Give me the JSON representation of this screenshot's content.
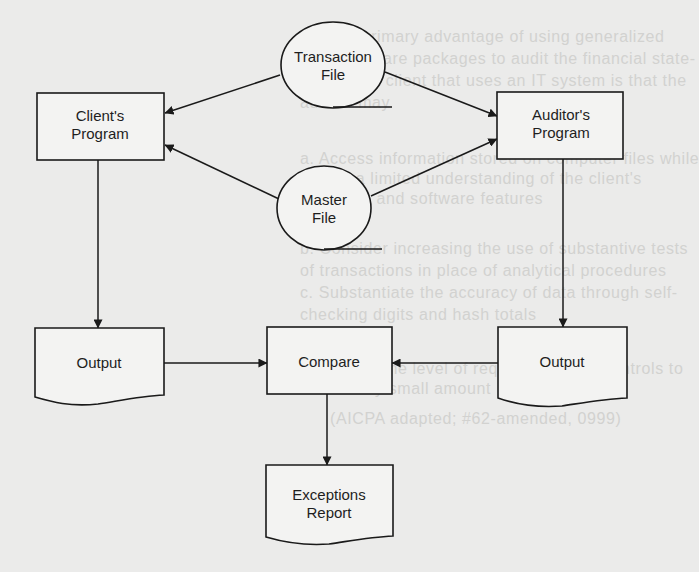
{
  "diagram": {
    "type": "flowchart",
    "colors": {
      "background": "#ebebea",
      "stroke": "#1a1a1a",
      "text": "#1e1e1e",
      "bleed_text": "#d2d2d0"
    },
    "nodes": {
      "transaction_file": {
        "shape": "storage-circle",
        "line1": "Transaction",
        "line2": "File"
      },
      "master_file": {
        "shape": "storage-circle",
        "line1": "Master",
        "line2": "File"
      },
      "clients_program": {
        "shape": "process",
        "line1": "Client's",
        "line2": "Program"
      },
      "auditors_program": {
        "shape": "process",
        "line1": "Auditor's",
        "line2": "Program"
      },
      "output_client": {
        "shape": "document",
        "label": "Output"
      },
      "compare": {
        "shape": "process",
        "label": "Compare"
      },
      "output_auditor": {
        "shape": "document",
        "label": "Output"
      },
      "exceptions_report": {
        "shape": "document",
        "line1": "Exceptions",
        "line2": "Report"
      }
    },
    "edges": [
      {
        "from": "transaction_file",
        "to": "clients_program"
      },
      {
        "from": "transaction_file",
        "to": "auditors_program"
      },
      {
        "from": "master_file",
        "to": "clients_program"
      },
      {
        "from": "master_file",
        "to": "auditors_program"
      },
      {
        "from": "clients_program",
        "to": "output_client"
      },
      {
        "from": "auditors_program",
        "to": "output_auditor"
      },
      {
        "from": "output_client",
        "to": "compare"
      },
      {
        "from": "output_auditor",
        "to": "compare"
      },
      {
        "from": "compare",
        "to": "exceptions_report"
      }
    ]
  },
  "bleed_through_text": [
    "29.  A primary advantage of using generalized",
    "audit software packages to audit the financial state-",
    "ments of a client that uses an IT system is that the",
    "auditor may",
    "a.  Access information stored on computer files while",
    "     having a limited understanding of the client's",
    "     hardware and software features",
    "b.  Consider increasing the use of substantive tests",
    "     of transactions in place of analytical procedures",
    "c.  Substantiate the accuracy of data through self-",
    "     checking digits and hash totals",
    "d.  Reduce the level of required tests of controls to",
    "     a relatively small amount",
    "(AICPA adapted; #62-amended, 0999)"
  ]
}
